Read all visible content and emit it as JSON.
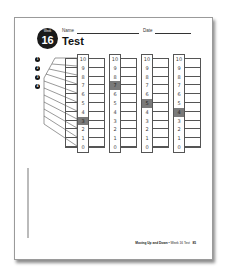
{
  "worksheet": {
    "badge": {
      "label": "Week",
      "number": "16"
    },
    "name_label": "Name",
    "date_label": "Date",
    "title": "Test",
    "bullets": [
      "1",
      "2",
      "3",
      "4"
    ],
    "scale": [
      "10",
      "9",
      "8",
      "7",
      "6",
      "5",
      "4",
      "3",
      "2",
      "1",
      "0"
    ],
    "columns": [
      {
        "id": 1,
        "highlighted": "3"
      },
      {
        "id": 2,
        "highlighted": "7"
      },
      {
        "id": 3,
        "highlighted": "5"
      },
      {
        "id": 4,
        "highlighted": "4"
      }
    ],
    "footer": {
      "unit": "Moving Up and Down",
      "separator": " • ",
      "section": "Week 16 Test",
      "page": "85"
    },
    "colors": {
      "highlight": "#7a7a7a",
      "ink": "#111111"
    }
  }
}
